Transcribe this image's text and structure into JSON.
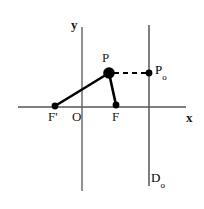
{
  "figure": {
    "background_color": "#ffffff",
    "axis_color": "#555555",
    "stroke_color": "#000000",
    "width": 204,
    "height": 209
  },
  "axes": {
    "x_label": "x",
    "y_label": "y",
    "origin_label": "O",
    "x_axis": {
      "x1": 18,
      "y1": 107,
      "x2": 186,
      "y2": 107
    },
    "y_axis": {
      "x1": 82,
      "y1": 27,
      "x2": 82,
      "y2": 191
    },
    "x_label_pos": {
      "x": 186,
      "y": 118
    },
    "y_label_pos": {
      "x": 71,
      "y": 25
    },
    "origin_label_pos": {
      "x": 72,
      "y": 112
    }
  },
  "directrix": {
    "label": "D",
    "label_subscript": "o",
    "line": {
      "x1": 149,
      "y1": 25,
      "x2": 149,
      "y2": 186
    },
    "label_pos": {
      "x": 151,
      "y": 174
    }
  },
  "points": [
    {
      "name": "focus-prime",
      "label": "F'",
      "label_subscript": "",
      "x": 55,
      "y": 106,
      "radius": 3.2,
      "label_pos": {
        "x": 48,
        "y": 112
      }
    },
    {
      "name": "focus",
      "label": "F",
      "label_subscript": "",
      "x": 116,
      "y": 105,
      "radius": 3.2,
      "label_pos": {
        "x": 112,
        "y": 112
      }
    },
    {
      "name": "point-p",
      "label": "P",
      "label_subscript": "",
      "x": 109,
      "y": 73,
      "radius": 5.6,
      "label_pos": {
        "x": 101,
        "y": 52
      }
    },
    {
      "name": "point-p-zero",
      "label": "P",
      "label_subscript": "o",
      "x": 149,
      "y": 73,
      "radius": 3.2,
      "label_pos": {
        "x": 154,
        "y": 63
      }
    }
  ],
  "segments": [
    {
      "name": "focal-radius-f-prime-p",
      "from": "F'",
      "to": "P",
      "x1": 55,
      "y1": 106,
      "x2": 109,
      "y2": 73,
      "style": "solid",
      "width": 2.6
    },
    {
      "name": "focal-radius-p-f",
      "from": "P",
      "to": "F",
      "x1": 109,
      "y1": 73,
      "x2": 116,
      "y2": 105,
      "style": "solid",
      "width": 2.6
    },
    {
      "name": "directrix-distance-p-p-zero",
      "from": "P",
      "to": "Po",
      "x1": 113,
      "y1": 73,
      "x2": 146,
      "y2": 73,
      "style": "dashed",
      "width": 2.2,
      "dash_pattern": "5,4"
    }
  ]
}
